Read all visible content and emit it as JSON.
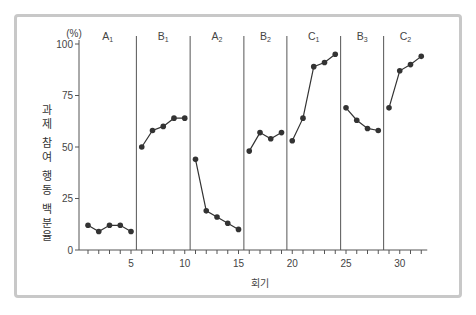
{
  "chart_data": {
    "type": "line",
    "title": "",
    "xlabel": "회기",
    "ylabel": "과제 참여 행동 백분율",
    "y_unit": "(%)",
    "ylim": [
      0,
      100
    ],
    "yticks": [
      0,
      25,
      50,
      75,
      100
    ],
    "xlim": [
      1,
      32
    ],
    "xticks_labeled": [
      5,
      10,
      15,
      20,
      25,
      30
    ],
    "grid": false,
    "legend": null,
    "phases": [
      {
        "label": "A1",
        "base": "A",
        "sub": "1",
        "sessions": [
          1,
          2,
          3,
          4,
          5
        ],
        "values": [
          12,
          9,
          12,
          12,
          9
        ]
      },
      {
        "label": "B1",
        "base": "B",
        "sub": "1",
        "sessions": [
          6,
          7,
          8,
          9,
          10
        ],
        "values": [
          50,
          58,
          60,
          64,
          64
        ]
      },
      {
        "label": "A2",
        "base": "A",
        "sub": "2",
        "sessions": [
          11,
          12,
          13,
          14,
          15
        ],
        "values": [
          44,
          19,
          16,
          13,
          10
        ]
      },
      {
        "label": "B2",
        "base": "B",
        "sub": "2",
        "sessions": [
          16,
          17,
          18,
          19
        ],
        "values": [
          48,
          57,
          54,
          57
        ]
      },
      {
        "label": "C1",
        "base": "C",
        "sub": "1",
        "sessions": [
          20,
          21,
          22,
          23,
          24
        ],
        "values": [
          53,
          64,
          89,
          91,
          95
        ]
      },
      {
        "label": "B3",
        "base": "B",
        "sub": "3",
        "sessions": [
          25,
          26,
          27,
          28
        ],
        "values": [
          69,
          63,
          59,
          58
        ]
      },
      {
        "label": "C2",
        "base": "C",
        "sub": "2",
        "sessions": [
          29,
          30,
          31,
          32
        ],
        "values": [
          69,
          87,
          90,
          94
        ]
      }
    ],
    "phase_dividers_after": [
      5.5,
      10.5,
      15.5,
      19.5,
      24.5,
      28.5
    ]
  },
  "labels": {
    "y_unit": "(%)",
    "xlabel": "회기",
    "ylabel_chars": [
      "과",
      "제",
      "",
      "참",
      "여",
      "",
      "행",
      "동",
      "",
      "백",
      "분",
      "율"
    ]
  },
  "colors": {
    "line": "#333333",
    "marker": "#333333",
    "axis": "#555555",
    "frame": "#c8c8c8",
    "text": "#444444"
  }
}
